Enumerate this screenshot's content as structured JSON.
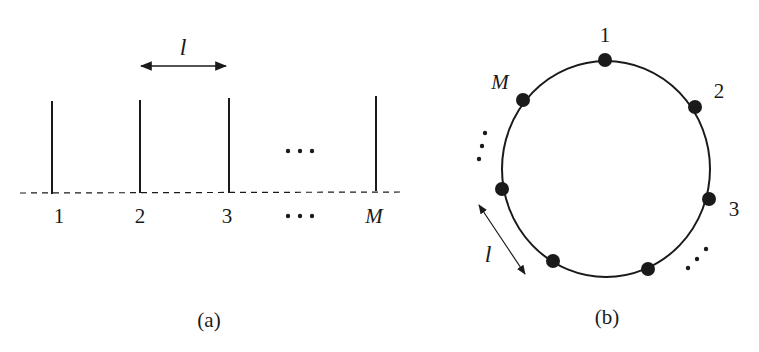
{
  "figure_a": {
    "caption": "(a)",
    "spacing_label": "l",
    "element_labels": [
      "1",
      "2",
      "3",
      "M"
    ],
    "ellipsis_label": "···",
    "element_x": [
      52,
      140,
      229,
      376
    ],
    "element_top_y": 100,
    "baseline_y": 193
  },
  "figure_b": {
    "caption": "(b)",
    "spacing_label": "l",
    "circle": {
      "cx": 606,
      "cy": 169,
      "rx": 104,
      "ry": 108
    },
    "nodes": [
      {
        "label": "1",
        "x": 605,
        "y": 60
      },
      {
        "label": "2",
        "x": 695,
        "y": 107
      },
      {
        "label": "3",
        "x": 709,
        "y": 199
      },
      {
        "label": "",
        "x": 648,
        "y": 269
      },
      {
        "label": "",
        "x": 553,
        "y": 261
      },
      {
        "label": "",
        "x": 502,
        "y": 189
      },
      {
        "label": "M",
        "x": 523,
        "y": 100
      }
    ]
  },
  "colors": {
    "stroke": "#1a1a1a",
    "background": "#ffffff"
  }
}
